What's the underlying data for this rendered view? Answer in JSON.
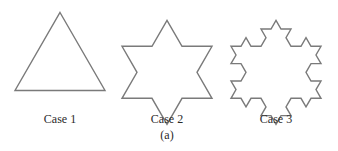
{
  "figure": {
    "caption": "(a)",
    "stroke_color": "#7a7a7a",
    "cases": [
      {
        "label": "Case 1",
        "shape": "triangle",
        "iteration": 0
      },
      {
        "label": "Case 2",
        "shape": "hexagram-star",
        "iteration": 1
      },
      {
        "label": "Case 3",
        "shape": "koch-snowflake",
        "iteration": 2
      }
    ]
  }
}
